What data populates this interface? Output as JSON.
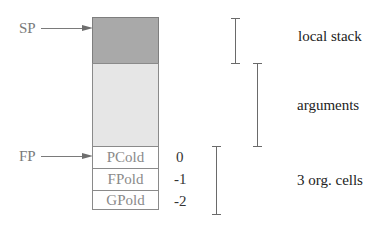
{
  "pointers": {
    "sp": "SP",
    "fp": "FP"
  },
  "stack": {
    "regions": [
      {
        "name": "local-stack-region",
        "color": "#a9a9a9"
      },
      {
        "name": "arguments-region",
        "color": "#e6e6e6"
      }
    ],
    "cells": [
      {
        "label": "PCold",
        "offset": "0"
      },
      {
        "label": "FPold",
        "offset": "-1"
      },
      {
        "label": "GPold",
        "offset": "-2"
      }
    ]
  },
  "brackets": {
    "local_stack": "local stack",
    "arguments": "arguments",
    "org_cells": "3 org. cells"
  }
}
